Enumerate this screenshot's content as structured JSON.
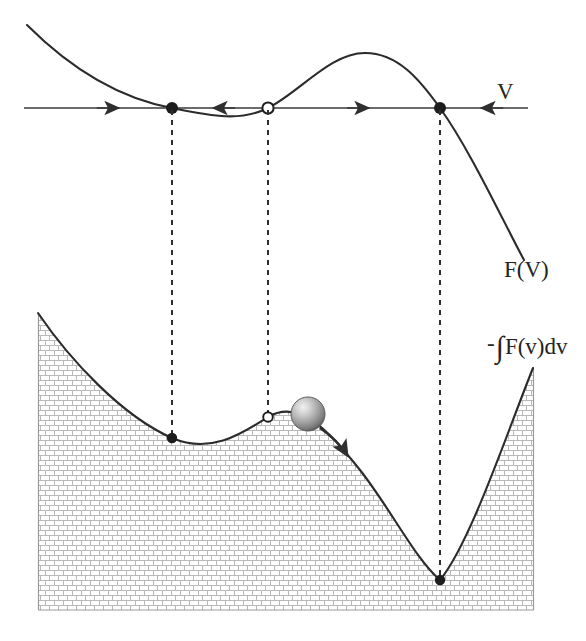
{
  "figure": {
    "labels": {
      "axis_label": "V",
      "force_curve_label": "F(V)",
      "potential_label_minus": "-",
      "potential_label_integral": "∫",
      "potential_label_rest": "F(v)dv",
      "potential_label_full": "-∫F(v)dv"
    },
    "colors": {
      "curve": "#2b2b2b",
      "axis": "#3a3a3a",
      "dashed": "#2f2f2f",
      "hatch_line": "#b4b4b4",
      "hatch_bg": "#ffffff",
      "ball_light": "#e8e8e8",
      "ball_mid": "#a8a8a8",
      "ball_dark": "#6e6e6e",
      "text": "#232323"
    },
    "top_panel": {
      "axis": {
        "x1": 24,
        "x2": 528,
        "y": 108
      },
      "flow_arrows": [
        {
          "x": 108,
          "y": 108,
          "direction": "right"
        },
        {
          "x": 224,
          "y": 108,
          "direction": "left"
        },
        {
          "x": 358,
          "y": 108,
          "direction": "right"
        },
        {
          "x": 492,
          "y": 108,
          "direction": "left"
        }
      ],
      "fixed_points": [
        {
          "x": 172,
          "y": 108,
          "type": "stable",
          "marker": "filled"
        },
        {
          "x": 268,
          "y": 108,
          "type": "unstable",
          "marker": "open"
        },
        {
          "x": 440,
          "y": 108,
          "type": "stable",
          "marker": "filled"
        }
      ],
      "curve_path": "M 27,25 C 70,68 118,98 172,108 C 212,116 240,122 268,108 C 300,92 330,53 365,53 C 398,53 420,80 440,108 C 470,150 500,215 524,260"
    },
    "bottom_panel": {
      "hatched_box": {
        "x": 38,
        "y": 313,
        "width": 496,
        "height": 297
      },
      "dashed_connectors": [
        {
          "x": 172,
          "y1": 108,
          "y2": 438
        },
        {
          "x": 268,
          "y1": 108,
          "y2": 417
        },
        {
          "x": 440,
          "y1": 108,
          "y2": 580
        }
      ],
      "potential_curve": "M 38,313 C 70,360 122,416 172,438 C 212,455 244,432 268,417 C 300,398 330,432 360,470 C 390,508 416,560 440,580 C 470,544 508,430 533,368",
      "extrema": [
        {
          "x": 172,
          "y": 438,
          "type": "local-minimum",
          "marker": "filled"
        },
        {
          "x": 268,
          "y": 417,
          "type": "local-maximum",
          "marker": "open"
        },
        {
          "x": 440,
          "y": 580,
          "type": "global-minimum",
          "marker": "filled"
        }
      ],
      "ball": {
        "cx": 308,
        "cy": 414,
        "r": 17
      },
      "motion_arrow": {
        "path": "M 320,428 C 333,437 341,445 347,455",
        "direction": "down-right"
      }
    }
  }
}
